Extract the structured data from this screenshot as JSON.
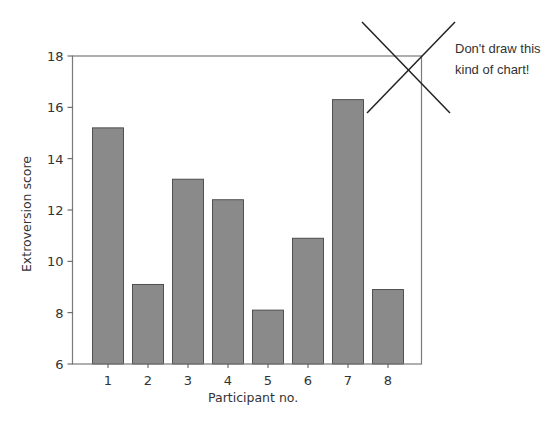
{
  "chart_data": {
    "type": "bar",
    "title": "",
    "xlabel": "Participant no.",
    "ylabel": "Extroversion score",
    "categories": [
      "1",
      "2",
      "3",
      "4",
      "5",
      "6",
      "7",
      "8"
    ],
    "values": [
      15.2,
      9.1,
      13.2,
      12.4,
      8.1,
      10.9,
      16.3,
      8.9
    ],
    "ylim": [
      6,
      18
    ],
    "yticks": [
      6,
      8,
      10,
      12,
      14,
      16,
      18
    ],
    "grid": false,
    "legend": null,
    "bar_color": "#8a8a8a",
    "bar_edge_color": "#444444",
    "annotations": [
      {
        "type": "cross-out",
        "description": "Large X drawn over the top-right corner of the chart"
      },
      {
        "type": "text",
        "lines": [
          "Don't draw this",
          "kind of chart!"
        ]
      }
    ]
  },
  "annotation": {
    "line1": "Don't draw this",
    "line2": "kind of chart!"
  }
}
